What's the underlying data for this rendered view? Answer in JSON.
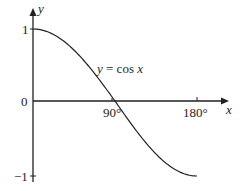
{
  "chart_data": {
    "type": "line",
    "title": "",
    "xlabel": "x",
    "ylabel": "y",
    "series": [
      {
        "name": "y = cos x",
        "x": [
          0,
          15,
          30,
          45,
          60,
          75,
          90,
          105,
          120,
          135,
          150,
          165,
          180
        ],
        "values": [
          1,
          0.966,
          0.866,
          0.707,
          0.5,
          0.259,
          0,
          -0.259,
          -0.5,
          -0.707,
          -0.866,
          -0.966,
          -1
        ]
      }
    ],
    "xlim": [
      0,
      180
    ],
    "ylim": [
      -1,
      1
    ],
    "x_ticks": [
      "90°",
      "180°"
    ],
    "y_ticks": [
      "1",
      "0",
      "−1"
    ],
    "annotations": [
      "y = cos x"
    ],
    "grid": false,
    "legend": "none"
  },
  "labels": {
    "y_axis": "y",
    "x_axis": "x",
    "y_tick_top": "1",
    "y_tick_zero": "0",
    "y_tick_bottom": "−1",
    "x_tick_90": "90°",
    "x_tick_180": "180°",
    "curve_label_lhs": "y",
    "curve_label_eq": " = cos ",
    "curve_label_var": "x"
  },
  "colors": {
    "ink": "#231f20",
    "background": "#ffffff"
  }
}
